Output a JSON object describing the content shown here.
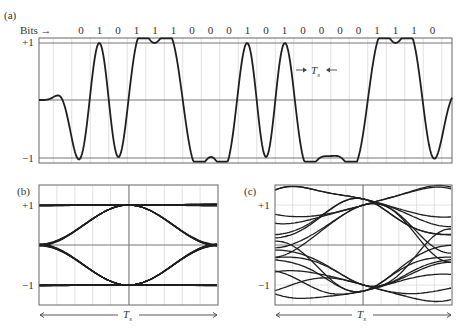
{
  "panels": {
    "a": {
      "tag": "(a)",
      "bits_label": "Bits →",
      "bits": [
        "0",
        "1",
        "0",
        "1",
        "1",
        "1",
        "0",
        "0",
        "0",
        "1",
        "0",
        "1",
        "0",
        "0",
        "0",
        "0",
        "1",
        "1",
        "1",
        "0"
      ],
      "y_plus": "+1",
      "y_minus": "−1",
      "ts_label": "T",
      "ts_sub": "s",
      "ts_arrows": "→ ←"
    },
    "b": {
      "tag": "(b)",
      "y_plus": "+1",
      "y_minus": "−1",
      "ts_label": "T",
      "ts_sub": "s",
      "description": "Eye diagram with wide-open eye"
    },
    "c": {
      "tag": "(c)",
      "y_plus": "+1",
      "y_minus": "−1",
      "ts_label": "T",
      "ts_sub": "s",
      "description": "Eye diagram with more closed eye (intersymbol interference)"
    }
  },
  "chart_data": [
    {
      "type": "line",
      "title": "(a) Baseband waveform for bit sequence",
      "xlabel": "Bits",
      "ylabel": "",
      "categories": [
        "0",
        "1",
        "0",
        "1",
        "1",
        "1",
        "0",
        "0",
        "0",
        "1",
        "0",
        "1",
        "0",
        "0",
        "0",
        "0",
        "1",
        "1",
        "1",
        "0"
      ],
      "levels": [
        -1,
        1,
        -1,
        1,
        1,
        1,
        -1,
        -1,
        -1,
        1,
        -1,
        1,
        -1,
        -1,
        -1,
        -1,
        1,
        1,
        1,
        -1
      ],
      "ylim": [
        -1,
        1
      ],
      "yticks": [
        "+1",
        "−1"
      ],
      "annotation": "→ Ts ←"
    },
    {
      "type": "line",
      "title": "(b) Eye diagram",
      "xlabel": "Ts",
      "yticks": [
        "+1",
        "−1"
      ],
      "ylim": [
        -1,
        1
      ]
    },
    {
      "type": "line",
      "title": "(c) Eye diagram",
      "xlabel": "Ts",
      "yticks": [
        "+1",
        "−1"
      ],
      "ylim": [
        -1,
        1
      ]
    }
  ]
}
